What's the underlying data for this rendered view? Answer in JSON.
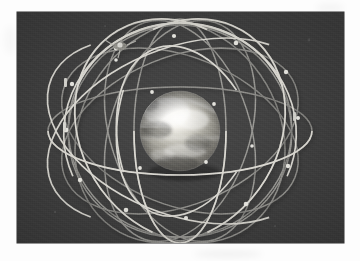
{
  "page": {
    "background_color": "#fdfdfd",
    "margin_smudges": [
      {
        "cx": 228,
        "cy": 254,
        "rx": 34,
        "ry": 4,
        "color": "rgba(0,0,0,0.05)"
      },
      {
        "cx": 330,
        "cy": 8,
        "rx": 14,
        "ry": 5,
        "color": "rgba(0,0,0,0.035)"
      },
      {
        "cx": 10,
        "cy": 40,
        "rx": 6,
        "ry": 14,
        "color": "rgba(0,0,0,0.03)"
      }
    ]
  },
  "photo": {
    "caption": "",
    "subject": "satellite-constellation-model",
    "description": "Photograph of a physical satellite constellation model: a polished reflective metal globe encircled by numerous thin inclined orbital rings carrying small satellite nodes, shot against a dark grey studio backdrop.",
    "frame": {
      "x": 17,
      "y": 12,
      "width": 327,
      "height": 231
    },
    "backdrop_color": "#3f3f3f",
    "wire_color": "#d8d7d2",
    "wire_shadow_color": "#1f1f1f",
    "node_color": "#e8e7e2",
    "globe": {
      "center_x": 180,
      "center_y": 131,
      "radius": 40,
      "highlight_color": "#f6f5f1",
      "body_color": "#9a9992",
      "shadow_color": "#4a4a46",
      "label": "reflective-metal-globe"
    },
    "rings": [
      {
        "id": "ring-equatorial-outer",
        "rx": 132,
        "ry": 44,
        "rotate": 0,
        "inclination_deg": 0
      },
      {
        "id": "ring-polar-1",
        "rx": 46,
        "ry": 112,
        "rotate": 0,
        "inclination_deg": 90
      },
      {
        "id": "ring-polar-2",
        "rx": 70,
        "ry": 114,
        "rotate": 18,
        "inclination_deg": 72
      },
      {
        "id": "ring-polar-3",
        "rx": 70,
        "ry": 114,
        "rotate": -18,
        "inclination_deg": 72
      },
      {
        "id": "ring-inclined-1",
        "rx": 124,
        "ry": 74,
        "rotate": 22,
        "inclination_deg": 55
      },
      {
        "id": "ring-inclined-2",
        "rx": 124,
        "ry": 74,
        "rotate": -22,
        "inclination_deg": 55
      },
      {
        "id": "ring-inclined-3",
        "rx": 118,
        "ry": 98,
        "rotate": 55,
        "inclination_deg": 35
      },
      {
        "id": "ring-inclined-4",
        "rx": 118,
        "ry": 98,
        "rotate": -55,
        "inclination_deg": 35
      },
      {
        "id": "ring-inclined-5",
        "rx": 106,
        "ry": 112,
        "rotate": 78,
        "inclination_deg": 18
      },
      {
        "id": "ring-inclined-6",
        "rx": 106,
        "ry": 112,
        "rotate": -78,
        "inclination_deg": 18
      }
    ],
    "satellite_nodes": [
      {
        "x": 116,
        "y": 48
      },
      {
        "x": 174,
        "y": 36
      },
      {
        "x": 236,
        "y": 43
      },
      {
        "x": 286,
        "y": 72
      },
      {
        "x": 298,
        "y": 118
      },
      {
        "x": 288,
        "y": 166
      },
      {
        "x": 246,
        "y": 204
      },
      {
        "x": 186,
        "y": 218
      },
      {
        "x": 126,
        "y": 210
      },
      {
        "x": 80,
        "y": 180
      },
      {
        "x": 66,
        "y": 130
      },
      {
        "x": 72,
        "y": 84
      },
      {
        "x": 152,
        "y": 92
      },
      {
        "x": 214,
        "y": 104
      },
      {
        "x": 206,
        "y": 162
      },
      {
        "x": 140,
        "y": 168
      },
      {
        "x": 116,
        "y": 60
      },
      {
        "x": 252,
        "y": 146
      }
    ],
    "instrument_marker": {
      "x": 120,
      "y": 46,
      "label": "satellite-model-top"
    }
  }
}
